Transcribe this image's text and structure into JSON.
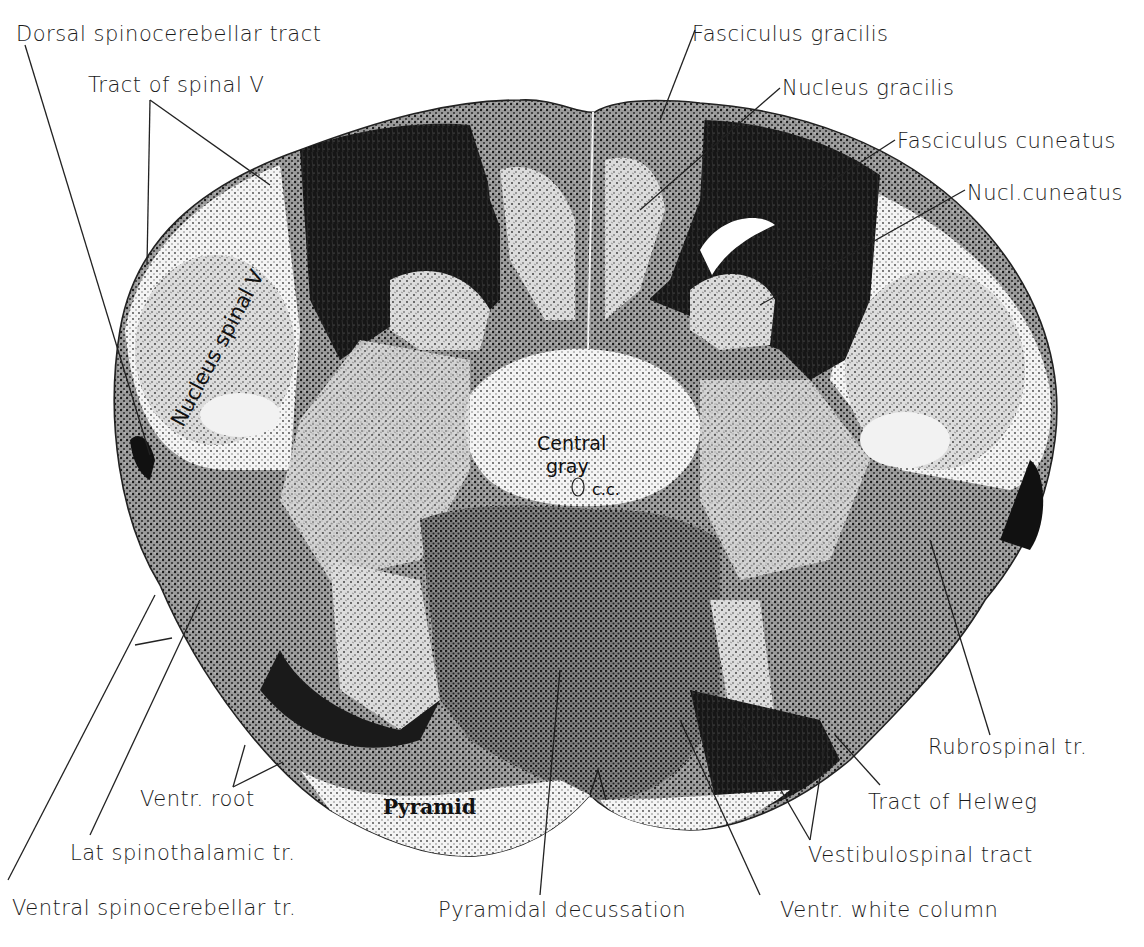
{
  "figure": {
    "colors": {
      "background": "#ffffff",
      "ink": "#111111",
      "fiber_dark": "#1c1c1c",
      "gray_matter": "#e9e9e9",
      "stipple": "#555555"
    }
  },
  "labels": {
    "dorsal_spinocerebellar": "Dorsal spinocerebellar tract",
    "tract_spinal_v": "Tract of spinal Ⅴ",
    "fasciculus_gracilis": "Fasciculus gracilis",
    "nucleus_gracilis": "Nucleus gracilis",
    "fasciculus_cuneatus": "Fasciculus cuneatus",
    "nucl_cuneatus": "Nucl.cuneatus",
    "rubrospinal": "Rubrospinal tr.",
    "tract_helweg": "Tract of Helweg",
    "vestibulospinal": "Vestibulospinal tract",
    "ventr_white_column": "Ventr. white column",
    "pyramidal_decussation": "Pyramidal decussation",
    "ventral_spinocerebellar": "Ventral spinocerebellar tr.",
    "lat_spinothalamic": "Lat spinothalamic tr.",
    "ventr_root": "Ventr. root"
  },
  "inner_labels": {
    "nucleus_spinal_v": "Nucleus spinal Ⅴ",
    "central_gray_1": "Central",
    "central_gray_2": "gray",
    "central_canal": "c.c.",
    "pyramid": "Pyramid"
  }
}
